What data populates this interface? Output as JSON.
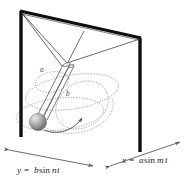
{
  "figure": {
    "background_color": "#ffffff",
    "frame": {
      "color": "#111111",
      "description": "upright rectangular frame in perspective with two vertical posts and a top beam"
    },
    "pendulum": {
      "rod_color": "#555555",
      "bob_color_dark": "#6f6f6f",
      "bob_color_light": "#d8d8d8",
      "suspension_lines_color": "#3a3a3a"
    },
    "orbit": {
      "color": "#9a9a9a",
      "style": "dotted",
      "description": "dotted elliptical Lissajous path traced by the bob"
    },
    "motion_arrow": {
      "color": "#4a4a4a",
      "description": "curved arrow showing direction of swing"
    },
    "axes": {
      "arrow_color": "#5a5a5a",
      "y_axis": {
        "equation": "y = b sin nt",
        "parts": {
          "variable": "y",
          "equals": "=",
          "amplitude": "b",
          "function": "sin",
          "frequency": "n",
          "time": "t"
        }
      },
      "x_axis": {
        "equation": "x = a sin mt",
        "parts": {
          "variable": "x",
          "equals": "=",
          "amplitude": "a",
          "function": "sin",
          "frequency": "m",
          "time": "t"
        }
      }
    },
    "amplitude_labels": [
      {
        "name": "a",
        "text": "a"
      },
      {
        "name": "b",
        "text": "b"
      }
    ]
  }
}
